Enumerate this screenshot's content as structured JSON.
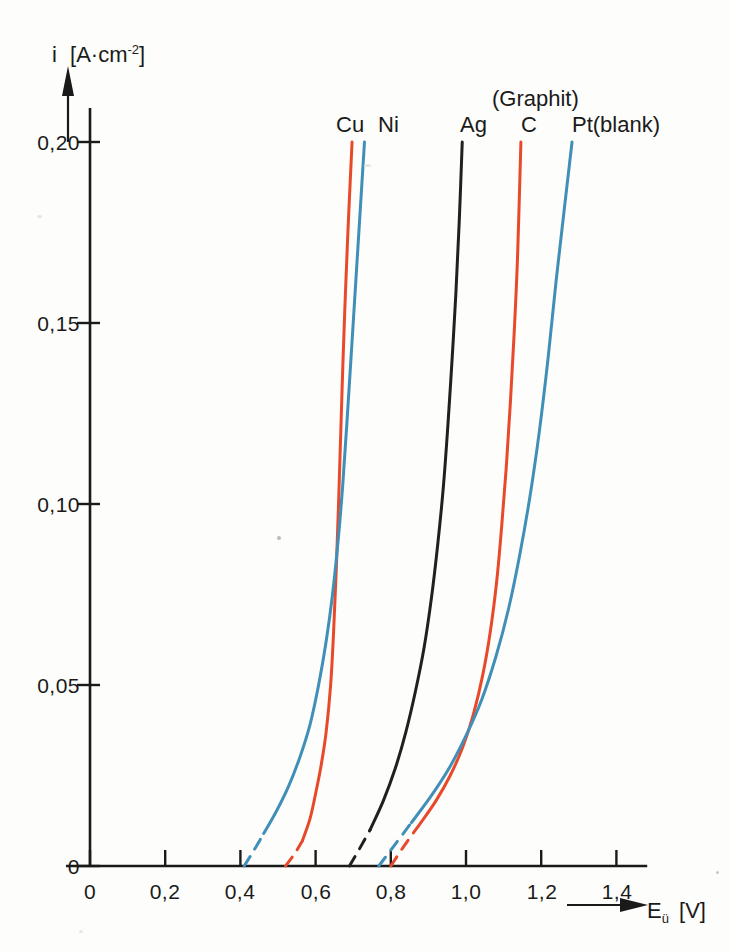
{
  "figure": {
    "background_color": "#fdfdfb",
    "axis_color": "#1a1a1a"
  },
  "axes": {
    "y_axis": {
      "label_symbol": "i",
      "label_unit_open": "[A",
      "label_unit_mid": "·cm",
      "label_unit_exp": "-2",
      "label_unit_close": "]",
      "label_full": "i [A·cm-2]",
      "ticks": [
        "0",
        "0,05",
        "0,10",
        "0,15",
        "0,20"
      ],
      "tick_values": [
        0,
        0.05,
        0.1,
        0.15,
        0.2
      ],
      "has_arrow": true
    },
    "x_axis": {
      "label_symbol": "E",
      "label_sub": "ü",
      "label_unit": "[V]",
      "label_full": "Eü [V]",
      "ticks": [
        "0",
        "0,2",
        "0,4",
        "0,6",
        "0,8",
        "1,0",
        "1,2",
        "1,4"
      ],
      "tick_values": [
        0,
        0.2,
        0.4,
        0.6,
        0.8,
        1.0,
        1.2,
        1.4
      ],
      "has_arrow": true
    }
  },
  "series_labels": {
    "cu": "Cu",
    "ni": "Ni",
    "ag": "Ag",
    "graphit": "(Graphit)",
    "c": "C",
    "pt": "Pt(blank)"
  },
  "chart_data": {
    "type": "line",
    "title": "",
    "subtitle": "",
    "xlabel": "Eü [V]",
    "ylabel": "i [A·cm-2]",
    "xlim": [
      0,
      1.45
    ],
    "ylim": [
      0,
      0.205
    ],
    "xticks": [
      0,
      0.2,
      0.4,
      0.6,
      0.8,
      1.0,
      1.2,
      1.4
    ],
    "yticks": [
      0,
      0.05,
      0.1,
      0.15,
      0.2
    ],
    "xtick_labels": [
      "0",
      "0,2",
      "0,4",
      "0,6",
      "0,8",
      "1,0",
      "1,2",
      "1,4"
    ],
    "ytick_labels": [
      "0",
      "0,05",
      "0,10",
      "0,15",
      "0,20"
    ],
    "grid": false,
    "legend_position": "top-inline-above-curves",
    "annotations": [
      {
        "text": "Cu",
        "x": 0.7,
        "y": 0.215
      },
      {
        "text": "Ni",
        "x": 0.79,
        "y": 0.215
      },
      {
        "text": "Ag",
        "x": 1.03,
        "y": 0.215
      },
      {
        "text": "(Graphit)",
        "x": 1.17,
        "y": 0.228
      },
      {
        "text": "C",
        "x": 1.17,
        "y": 0.215
      },
      {
        "text": "Pt(blank)",
        "x": 1.37,
        "y": 0.215
      }
    ],
    "series": [
      {
        "name": "Cu",
        "color": "#e8492b",
        "style": "solid-with-dashed-extrapolation",
        "dashed_points": [
          [
            0.52,
            0.0
          ],
          [
            0.545,
            0.0035
          ],
          [
            0.565,
            0.007
          ]
        ],
        "points": [
          [
            0.565,
            0.007
          ],
          [
            0.585,
            0.013
          ],
          [
            0.6,
            0.02
          ],
          [
            0.615,
            0.028
          ],
          [
            0.628,
            0.037
          ],
          [
            0.64,
            0.05
          ],
          [
            0.648,
            0.065
          ],
          [
            0.655,
            0.082
          ],
          [
            0.661,
            0.1
          ],
          [
            0.667,
            0.12
          ],
          [
            0.673,
            0.14
          ],
          [
            0.68,
            0.16
          ],
          [
            0.688,
            0.18
          ],
          [
            0.697,
            0.2
          ]
        ]
      },
      {
        "name": "Ni",
        "color": "#3f8fb8",
        "style": "solid-with-dashed-extrapolation",
        "dashed_points": [
          [
            0.41,
            0.0
          ],
          [
            0.437,
            0.0045
          ],
          [
            0.462,
            0.009
          ]
        ],
        "points": [
          [
            0.462,
            0.009
          ],
          [
            0.495,
            0.015
          ],
          [
            0.528,
            0.022
          ],
          [
            0.558,
            0.03
          ],
          [
            0.585,
            0.039
          ],
          [
            0.608,
            0.05
          ],
          [
            0.628,
            0.062
          ],
          [
            0.645,
            0.075
          ],
          [
            0.66,
            0.09
          ],
          [
            0.672,
            0.105
          ],
          [
            0.683,
            0.122
          ],
          [
            0.694,
            0.14
          ],
          [
            0.706,
            0.16
          ],
          [
            0.718,
            0.18
          ],
          [
            0.73,
            0.2
          ]
        ]
      },
      {
        "name": "Ag",
        "color": "#231f20",
        "style": "solid-with-dashed-extrapolation",
        "dashed_points": [
          [
            0.69,
            0.0
          ],
          [
            0.717,
            0.0048
          ],
          [
            0.745,
            0.01
          ]
        ],
        "points": [
          [
            0.745,
            0.01
          ],
          [
            0.78,
            0.018
          ],
          [
            0.812,
            0.027
          ],
          [
            0.84,
            0.037
          ],
          [
            0.865,
            0.048
          ],
          [
            0.888,
            0.06
          ],
          [
            0.908,
            0.074
          ],
          [
            0.925,
            0.089
          ],
          [
            0.94,
            0.105
          ],
          [
            0.952,
            0.122
          ],
          [
            0.963,
            0.14
          ],
          [
            0.973,
            0.158
          ],
          [
            0.982,
            0.178
          ],
          [
            0.99,
            0.2
          ]
        ]
      },
      {
        "name": "C",
        "color": "#e8492b",
        "style": "solid-with-dashed-extrapolation",
        "dashed_points": [
          [
            0.8,
            0.0
          ],
          [
            0.835,
            0.0055
          ],
          [
            0.88,
            0.012
          ]
        ],
        "points": [
          [
            0.88,
            0.012
          ],
          [
            0.92,
            0.018
          ],
          [
            0.958,
            0.025
          ],
          [
            0.992,
            0.033
          ],
          [
            1.02,
            0.042
          ],
          [
            1.045,
            0.053
          ],
          [
            1.065,
            0.065
          ],
          [
            1.082,
            0.079
          ],
          [
            1.095,
            0.094
          ],
          [
            1.107,
            0.11
          ],
          [
            1.118,
            0.128
          ],
          [
            1.128,
            0.147
          ],
          [
            1.137,
            0.168
          ],
          [
            1.146,
            0.2
          ]
        ]
      },
      {
        "name": "Pt(blank)",
        "color": "#3f8fb8",
        "style": "solid-with-dashed-extrapolation",
        "dashed_points": [
          [
            0.768,
            0.0
          ],
          [
            0.808,
            0.0055
          ],
          [
            0.855,
            0.012
          ]
        ],
        "points": [
          [
            0.855,
            0.012
          ],
          [
            0.905,
            0.019
          ],
          [
            0.955,
            0.027
          ],
          [
            1.0,
            0.036
          ],
          [
            1.042,
            0.046
          ],
          [
            1.08,
            0.058
          ],
          [
            1.113,
            0.071
          ],
          [
            1.143,
            0.086
          ],
          [
            1.17,
            0.102
          ],
          [
            1.195,
            0.12
          ],
          [
            1.218,
            0.14
          ],
          [
            1.24,
            0.162
          ],
          [
            1.262,
            0.182
          ],
          [
            1.282,
            0.2
          ]
        ]
      }
    ],
    "crossings": [
      {
        "series": [
          "Cu",
          "Ni"
        ],
        "x": 0.648,
        "y": 0.042
      },
      {
        "series": [
          "C",
          "Pt(blank)"
        ],
        "x": 0.982,
        "y": 0.023
      }
    ]
  }
}
